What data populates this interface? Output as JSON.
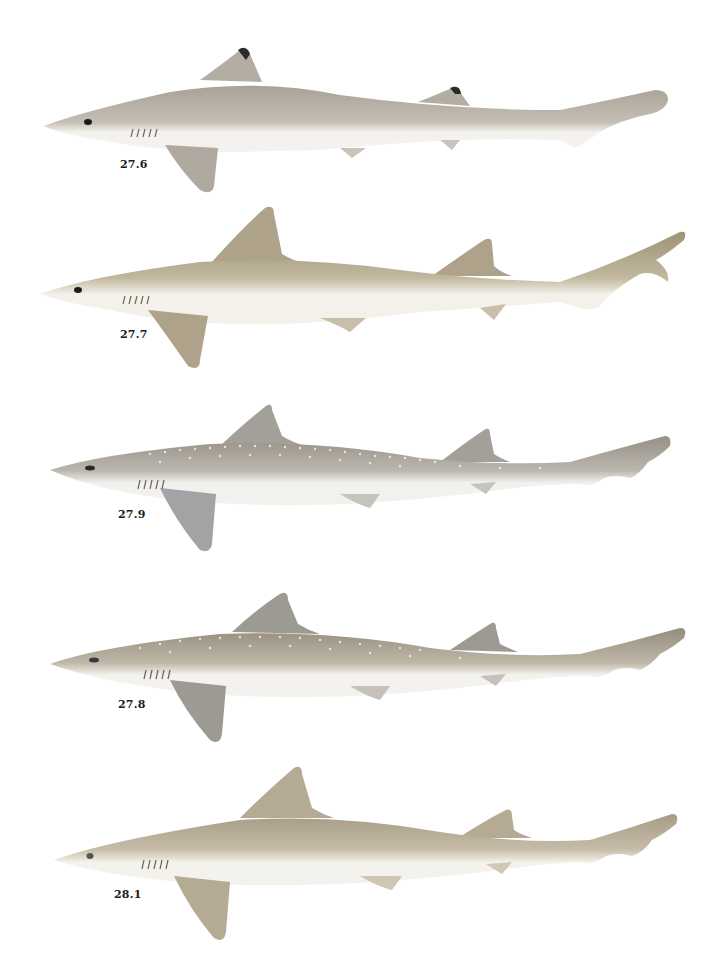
{
  "plate": {
    "figures": [
      {
        "id": "fig-1",
        "label": "27.6",
        "body_color": "#b9b2a8",
        "belly_color": "#f4f2ee",
        "fin_color": "#b0a9a0",
        "fin_tip_color": "#2a2a2a",
        "spots": false
      },
      {
        "id": "fig-2",
        "label": "27.7",
        "body_color": "#b3a88e",
        "belly_color": "#f3f1ea",
        "fin_color": "#aea38a",
        "fin_tip_color": "#aea38a",
        "spots": false
      },
      {
        "id": "fig-3",
        "label": "27.9",
        "body_color": "#a9a49b",
        "belly_color": "#f2f1ee",
        "fin_color": "#a3a3a6",
        "fin_tip_color": "#8c8c90",
        "spots": true
      },
      {
        "id": "fig-4",
        "label": "27.8",
        "body_color": "#aba394",
        "belly_color": "#f3f2ee",
        "fin_color": "#9d9a94",
        "fin_tip_color": "#7d7a74",
        "spots": true
      },
      {
        "id": "fig-5",
        "label": "28.1",
        "body_color": "#b8ad98",
        "belly_color": "#f4f2ec",
        "fin_color": "#b5aa94",
        "fin_tip_color": "#8a8070",
        "spots": false
      }
    ]
  }
}
